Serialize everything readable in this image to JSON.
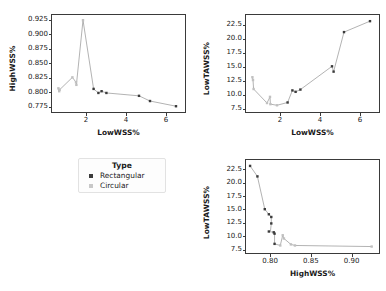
{
  "figure": {
    "background": "#ffffff",
    "line_color": "#9a9a9a",
    "marker_rect_color": "#3b3b3b",
    "marker_circ_color": "#c0c0c0",
    "axis_color": "#3a3a3a"
  },
  "legend": {
    "title": "Type",
    "items": [
      {
        "label": "Rectangular",
        "marker": "square-marker",
        "color": "#3b3b3b"
      },
      {
        "label": "Circular",
        "marker": "square-marker",
        "color": "#c0c0c0"
      }
    ]
  },
  "chart_data": [
    {
      "id": "panel-1",
      "type": "scatter",
      "title": "",
      "xlabel": "LowWSS%",
      "ylabel": "HighWSS%",
      "xlim": [
        0.3,
        6.95
      ],
      "ylim": [
        0.7655,
        0.9335
      ],
      "xticks": [
        2,
        4,
        6
      ],
      "xticklabels": [
        "2",
        "4",
        "6"
      ],
      "yticks": [
        0.775,
        0.8,
        0.825,
        0.85,
        0.875,
        0.9,
        0.925
      ],
      "yticklabels": [
        "0.775",
        "0.800",
        "0.825",
        "0.850",
        "0.875",
        "0.900",
        "0.925"
      ],
      "grid": false,
      "series": [
        {
          "name": "Rectangular",
          "color": "#3b3b3b",
          "points": [
            [
              2.38,
              0.8055
            ],
            [
              2.62,
              0.7985
            ],
            [
              2.78,
              0.8015
            ],
            [
              3.02,
              0.7985
            ],
            [
              4.65,
              0.7935
            ],
            [
              5.2,
              0.7845
            ],
            [
              6.5,
              0.7755
            ]
          ]
        },
        {
          "name": "Circular",
          "color": "#c0c0c0",
          "points": [
            [
              0.62,
              0.8065
            ],
            [
              0.66,
              0.8015
            ],
            [
              0.68,
              0.804
            ],
            [
              1.32,
              0.8255
            ],
            [
              1.5,
              0.817
            ],
            [
              1.52,
              0.8125
            ],
            [
              1.85,
              0.9245
            ]
          ]
        }
      ],
      "line_order": [
        [
          0.62,
          0.8065
        ],
        [
          0.66,
          0.8015
        ],
        [
          0.68,
          0.804
        ],
        [
          1.32,
          0.8255
        ],
        [
          1.5,
          0.817
        ],
        [
          1.52,
          0.8125
        ],
        [
          1.85,
          0.9245
        ],
        [
          2.38,
          0.8055
        ],
        [
          2.62,
          0.7985
        ],
        [
          2.78,
          0.8015
        ],
        [
          3.02,
          0.7985
        ],
        [
          4.65,
          0.7935
        ],
        [
          5.2,
          0.7845
        ],
        [
          6.5,
          0.7755
        ]
      ]
    },
    {
      "id": "panel-2",
      "type": "scatter",
      "title": "",
      "xlabel": "LowWSS%",
      "ylabel": "LowTAWSS%",
      "xlim": [
        0.3,
        6.95
      ],
      "ylim": [
        6.9,
        24.2
      ],
      "xticks": [
        2,
        4,
        6
      ],
      "xticklabels": [
        "2",
        "4",
        "6"
      ],
      "yticks": [
        7.5,
        10.0,
        12.5,
        15.0,
        17.5,
        20.0,
        22.5
      ],
      "yticklabels": [
        "7.5",
        "10.0",
        "12.5",
        "15.0",
        "17.5",
        "20.0",
        "22.5"
      ],
      "grid": false,
      "series": [
        {
          "name": "Rectangular",
          "color": "#3b3b3b",
          "points": [
            [
              2.38,
              8.6
            ],
            [
              2.62,
              10.75
            ],
            [
              2.78,
              10.5
            ],
            [
              3.02,
              10.9
            ],
            [
              4.6,
              15.05
            ],
            [
              4.68,
              14.1
            ],
            [
              5.2,
              21.15
            ],
            [
              6.5,
              23.1
            ]
          ]
        },
        {
          "name": "Circular",
          "color": "#c0c0c0",
          "points": [
            [
              0.62,
              13.1
            ],
            [
              0.65,
              12.6
            ],
            [
              0.68,
              11.0
            ],
            [
              1.35,
              8.5
            ],
            [
              1.5,
              9.6
            ],
            [
              1.52,
              8.3
            ],
            [
              1.85,
              8.1
            ]
          ]
        }
      ],
      "line_order": [
        [
          0.62,
          13.1
        ],
        [
          0.65,
          12.6
        ],
        [
          0.68,
          11.0
        ],
        [
          1.35,
          8.5
        ],
        [
          1.5,
          9.6
        ],
        [
          1.52,
          8.3
        ],
        [
          1.85,
          8.1
        ],
        [
          2.38,
          8.6
        ],
        [
          2.62,
          10.75
        ],
        [
          2.78,
          10.5
        ],
        [
          3.02,
          10.9
        ],
        [
          4.6,
          15.05
        ],
        [
          4.68,
          14.1
        ],
        [
          5.2,
          21.15
        ],
        [
          6.5,
          23.1
        ]
      ]
    },
    {
      "id": "panel-3",
      "type": "scatter",
      "title": "",
      "xlabel": "HighWSS%",
      "ylabel": "LowTAWSS%",
      "xlim": [
        0.7705,
        0.9335
      ],
      "ylim": [
        6.9,
        24.2
      ],
      "xticks": [
        0.8,
        0.85,
        0.9
      ],
      "xticklabels": [
        "0.80",
        "0.85",
        "0.90"
      ],
      "yticks": [
        7.5,
        10.0,
        12.5,
        15.0,
        17.5,
        20.0,
        22.5
      ],
      "yticklabels": [
        "7.5",
        "10.0",
        "12.5",
        "15.0",
        "17.5",
        "20.0",
        "22.5"
      ],
      "grid": false,
      "series": [
        {
          "name": "Rectangular",
          "color": "#3b3b3b",
          "points": [
            [
              0.7755,
              23.1
            ],
            [
              0.7845,
              21.15
            ],
            [
              0.7935,
              15.05
            ],
            [
              0.7985,
              14.1
            ],
            [
              0.8015,
              13.6
            ],
            [
              0.8015,
              12.4
            ],
            [
              0.7985,
              10.9
            ],
            [
              0.8055,
              10.5
            ],
            [
              0.8045,
              10.75
            ],
            [
              0.8055,
              8.6
            ]
          ]
        },
        {
          "name": "Circular",
          "color": "#c0c0c0",
          "points": [
            [
              0.8125,
              8.3
            ],
            [
              0.8155,
              10.2
            ],
            [
              0.817,
              9.6
            ],
            [
              0.8255,
              8.5
            ],
            [
              0.8305,
              8.3
            ],
            [
              0.9245,
              8.1
            ]
          ]
        }
      ],
      "line_order": [
        [
          0.7755,
          23.1
        ],
        [
          0.7845,
          21.15
        ],
        [
          0.7935,
          15.05
        ],
        [
          0.7985,
          14.1
        ],
        [
          0.8015,
          13.6
        ],
        [
          0.8015,
          12.4
        ],
        [
          0.8005,
          11.0
        ],
        [
          0.7985,
          10.9
        ],
        [
          0.8045,
          10.75
        ],
        [
          0.8055,
          10.5
        ],
        [
          0.8055,
          8.6
        ],
        [
          0.8125,
          8.3
        ],
        [
          0.8155,
          10.2
        ],
        [
          0.817,
          9.6
        ],
        [
          0.8255,
          8.5
        ],
        [
          0.8305,
          8.3
        ],
        [
          0.9245,
          8.1
        ]
      ]
    }
  ]
}
